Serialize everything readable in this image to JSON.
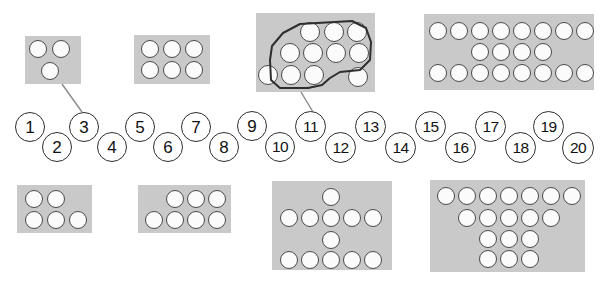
{
  "page": {
    "background_color": "#ffffff",
    "card_color": "#c9c9c9",
    "dot_fill_color": "#fbfbfb",
    "dot_outline_color": "#4a4a4a",
    "number_outline_color": "#2e2e2e",
    "lasso_color": "#2e2e2e",
    "connector_color": "#8a8a8a"
  },
  "number_line": {
    "name": "number-line-1-to-20",
    "count": 20,
    "tokens": [
      {
        "label": "1",
        "x": 15,
        "y": 112,
        "size": 30,
        "row": "upper"
      },
      {
        "label": "2",
        "x": 42,
        "y": 132,
        "size": 30,
        "row": "lower"
      },
      {
        "label": "3",
        "x": 69,
        "y": 112,
        "size": 30,
        "row": "upper"
      },
      {
        "label": "4",
        "x": 97,
        "y": 132,
        "size": 30,
        "row": "lower"
      },
      {
        "label": "5",
        "x": 125,
        "y": 112,
        "size": 30,
        "row": "upper"
      },
      {
        "label": "6",
        "x": 153,
        "y": 132,
        "size": 30,
        "row": "lower"
      },
      {
        "label": "7",
        "x": 181,
        "y": 112,
        "size": 30,
        "row": "upper"
      },
      {
        "label": "8",
        "x": 209,
        "y": 132,
        "size": 30,
        "row": "lower"
      },
      {
        "label": "9",
        "x": 237,
        "y": 111,
        "size": 30,
        "row": "upper"
      },
      {
        "label": "10",
        "x": 265,
        "y": 132,
        "size": 30,
        "row": "lower"
      },
      {
        "label": "11",
        "x": 295,
        "y": 111,
        "size": 31,
        "row": "upper"
      },
      {
        "label": "12",
        "x": 325,
        "y": 132,
        "size": 31,
        "row": "lower"
      },
      {
        "label": "13",
        "x": 355,
        "y": 111,
        "size": 31,
        "row": "upper"
      },
      {
        "label": "14",
        "x": 385,
        "y": 132,
        "size": 31,
        "row": "lower"
      },
      {
        "label": "15",
        "x": 415,
        "y": 111,
        "size": 31,
        "row": "upper"
      },
      {
        "label": "16",
        "x": 445,
        "y": 132,
        "size": 31,
        "row": "lower"
      },
      {
        "label": "17",
        "x": 475,
        "y": 111,
        "size": 31,
        "row": "upper"
      },
      {
        "label": "18",
        "x": 505,
        "y": 132,
        "size": 31,
        "row": "lower"
      },
      {
        "label": "19",
        "x": 533,
        "y": 111,
        "size": 31,
        "row": "upper"
      },
      {
        "label": "20",
        "x": 562,
        "y": 132,
        "size": 32,
        "row": "lower"
      }
    ]
  },
  "connectors": [
    {
      "name": "connector-card-3-dots-to-number-3",
      "from_x": 62,
      "from_y": 84,
      "to_x": 82,
      "to_y": 112
    },
    {
      "name": "connector-card-11-dots-to-number-11",
      "from_x": 301,
      "from_y": 92,
      "to_x": 313,
      "to_y": 112
    }
  ],
  "lasso": {
    "name": "lasso-outline-around-eleven-dots",
    "encircled_count": 11,
    "path": "M 270 60 L 272 46 L 283 33 L 300 24 L 352 21 L 366 28 L 371 42 L 370 60 L 360 70 L 340 72 L 330 78 L 322 85 L 308 88 L 280 88 L 271 80 Z"
  },
  "cards": [
    {
      "name": "dot-card-3",
      "dot_count": 3,
      "row_counts": [
        2,
        1
      ],
      "x": 25,
      "y": 36,
      "width": 56,
      "height": 48,
      "dots": [
        {
          "cx": 38,
          "cy": 49,
          "r": 9
        },
        {
          "cx": 61,
          "cy": 49,
          "r": 9
        },
        {
          "cx": 50,
          "cy": 71,
          "r": 9
        }
      ]
    },
    {
      "name": "dot-card-6",
      "dot_count": 6,
      "row_counts": [
        3,
        3
      ],
      "x": 134,
      "y": 35,
      "width": 76,
      "height": 49,
      "dots": [
        {
          "cx": 150,
          "cy": 49,
          "r": 9
        },
        {
          "cx": 172,
          "cy": 49,
          "r": 9
        },
        {
          "cx": 194,
          "cy": 49,
          "r": 9
        },
        {
          "cx": 150,
          "cy": 70,
          "r": 9
        },
        {
          "cx": 172,
          "cy": 70,
          "r": 9
        },
        {
          "cx": 194,
          "cy": 70,
          "r": 9
        }
      ]
    },
    {
      "name": "dot-card-12-with-lasso-of-11",
      "dot_count": 12,
      "row_counts": [
        3,
        4,
        4
      ],
      "x": 256,
      "y": 13,
      "width": 119,
      "height": 79,
      "dots": [
        {
          "cx": 310,
          "cy": 32,
          "r": 10,
          "inside_lasso": true
        },
        {
          "cx": 334,
          "cy": 32,
          "r": 10,
          "inside_lasso": true
        },
        {
          "cx": 357,
          "cy": 32,
          "r": 10,
          "inside_lasso": true
        },
        {
          "cx": 290,
          "cy": 53,
          "r": 10,
          "inside_lasso": true
        },
        {
          "cx": 313,
          "cy": 53,
          "r": 10,
          "inside_lasso": true
        },
        {
          "cx": 336,
          "cy": 53,
          "r": 10,
          "inside_lasso": true
        },
        {
          "cx": 359,
          "cy": 53,
          "r": 10,
          "inside_lasso": true
        },
        {
          "cx": 268,
          "cy": 75,
          "r": 10,
          "inside_lasso": true
        },
        {
          "cx": 291,
          "cy": 75,
          "r": 10,
          "inside_lasso": true
        },
        {
          "cx": 314,
          "cy": 75,
          "r": 10,
          "inside_lasso": true
        },
        {
          "cx": 337,
          "cy": 53,
          "r": 0,
          "inside_lasso": true
        },
        {
          "cx": 358,
          "cy": 77,
          "r": 10,
          "inside_lasso": false
        }
      ]
    },
    {
      "name": "dot-card-20",
      "dot_count": 20,
      "row_counts": [
        8,
        4,
        8
      ],
      "x": 424,
      "y": 14,
      "width": 170,
      "height": 76,
      "dots": [
        {
          "cx": 438,
          "cy": 31,
          "r": 9
        },
        {
          "cx": 459,
          "cy": 31,
          "r": 9
        },
        {
          "cx": 480,
          "cy": 31,
          "r": 9
        },
        {
          "cx": 501,
          "cy": 31,
          "r": 9
        },
        {
          "cx": 522,
          "cy": 31,
          "r": 9
        },
        {
          "cx": 543,
          "cy": 31,
          "r": 9
        },
        {
          "cx": 564,
          "cy": 31,
          "r": 9
        },
        {
          "cx": 585,
          "cy": 31,
          "r": 9
        },
        {
          "cx": 480,
          "cy": 52,
          "r": 9
        },
        {
          "cx": 501,
          "cy": 52,
          "r": 9
        },
        {
          "cx": 522,
          "cy": 52,
          "r": 9
        },
        {
          "cx": 543,
          "cy": 52,
          "r": 9
        },
        {
          "cx": 438,
          "cy": 73,
          "r": 9
        },
        {
          "cx": 459,
          "cy": 73,
          "r": 9
        },
        {
          "cx": 480,
          "cy": 73,
          "r": 9
        },
        {
          "cx": 501,
          "cy": 73,
          "r": 9
        },
        {
          "cx": 522,
          "cy": 73,
          "r": 9
        },
        {
          "cx": 543,
          "cy": 73,
          "r": 9
        },
        {
          "cx": 564,
          "cy": 73,
          "r": 9
        },
        {
          "cx": 585,
          "cy": 73,
          "r": 9
        }
      ]
    },
    {
      "name": "dot-card-5",
      "dot_count": 5,
      "row_counts": [
        2,
        3
      ],
      "x": 17,
      "y": 185,
      "width": 75,
      "height": 48,
      "dots": [
        {
          "cx": 34,
          "cy": 199,
          "r": 9
        },
        {
          "cx": 56,
          "cy": 199,
          "r": 9
        },
        {
          "cx": 34,
          "cy": 220,
          "r": 9
        },
        {
          "cx": 56,
          "cy": 220,
          "r": 9
        },
        {
          "cx": 78,
          "cy": 220,
          "r": 9
        }
      ]
    },
    {
      "name": "dot-card-7",
      "dot_count": 7,
      "row_counts": [
        3,
        4
      ],
      "x": 138,
      "y": 185,
      "width": 93,
      "height": 48,
      "dots": [
        {
          "cx": 175,
          "cy": 199,
          "r": 9
        },
        {
          "cx": 196,
          "cy": 199,
          "r": 9
        },
        {
          "cx": 217,
          "cy": 199,
          "r": 9
        },
        {
          "cx": 154,
          "cy": 220,
          "r": 9
        },
        {
          "cx": 175,
          "cy": 220,
          "r": 9
        },
        {
          "cx": 196,
          "cy": 220,
          "r": 9
        },
        {
          "cx": 217,
          "cy": 220,
          "r": 9
        }
      ]
    },
    {
      "name": "dot-card-12-cross",
      "dot_count": 12,
      "row_counts": [
        1,
        5,
        1,
        5
      ],
      "x": 272,
      "y": 181,
      "width": 120,
      "height": 89,
      "dots": [
        {
          "cx": 331,
          "cy": 197,
          "r": 9
        },
        {
          "cx": 289,
          "cy": 218,
          "r": 9
        },
        {
          "cx": 310,
          "cy": 218,
          "r": 9
        },
        {
          "cx": 331,
          "cy": 218,
          "r": 9
        },
        {
          "cx": 352,
          "cy": 218,
          "r": 9
        },
        {
          "cx": 373,
          "cy": 218,
          "r": 9
        },
        {
          "cx": 331,
          "cy": 240,
          "r": 9
        },
        {
          "cx": 289,
          "cy": 260,
          "r": 9
        },
        {
          "cx": 310,
          "cy": 260,
          "r": 9
        },
        {
          "cx": 331,
          "cy": 260,
          "r": 9
        },
        {
          "cx": 352,
          "cy": 260,
          "r": 9
        },
        {
          "cx": 373,
          "cy": 260,
          "r": 9
        }
      ]
    },
    {
      "name": "dot-card-18-pyramid",
      "dot_count": 18,
      "row_counts": [
        7,
        5,
        3,
        3
      ],
      "x": 430,
      "y": 180,
      "width": 155,
      "height": 92,
      "dots": [
        {
          "cx": 446,
          "cy": 196,
          "r": 9
        },
        {
          "cx": 467,
          "cy": 196,
          "r": 9
        },
        {
          "cx": 488,
          "cy": 196,
          "r": 9
        },
        {
          "cx": 509,
          "cy": 196,
          "r": 9
        },
        {
          "cx": 530,
          "cy": 196,
          "r": 9
        },
        {
          "cx": 551,
          "cy": 196,
          "r": 9
        },
        {
          "cx": 572,
          "cy": 196,
          "r": 9
        },
        {
          "cx": 467,
          "cy": 218,
          "r": 9
        },
        {
          "cx": 488,
          "cy": 218,
          "r": 9
        },
        {
          "cx": 509,
          "cy": 218,
          "r": 9
        },
        {
          "cx": 530,
          "cy": 218,
          "r": 9
        },
        {
          "cx": 551,
          "cy": 218,
          "r": 9
        },
        {
          "cx": 488,
          "cy": 239,
          "r": 9
        },
        {
          "cx": 509,
          "cy": 239,
          "r": 9
        },
        {
          "cx": 530,
          "cy": 239,
          "r": 9
        },
        {
          "cx": 488,
          "cy": 259,
          "r": 9
        },
        {
          "cx": 509,
          "cy": 259,
          "r": 9
        },
        {
          "cx": 530,
          "cy": 259,
          "r": 9
        }
      ]
    }
  ]
}
